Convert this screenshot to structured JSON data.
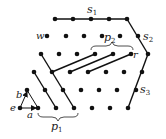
{
  "diagram": {
    "colors": {
      "dot": "#111111",
      "line": "#111111",
      "label": "#222222",
      "background": "#ffffff"
    },
    "labels": {
      "s1": "s",
      "s1_sub": "1",
      "s2": "s",
      "s2_sub": "2",
      "s3": "s",
      "s3_sub": "3",
      "p1": "p",
      "p1_sub": "1",
      "p2": "p",
      "p2_sub": "2",
      "w": "w",
      "r": "r",
      "a": "a",
      "b": "b",
      "e": "e"
    },
    "dots": [
      [
        55,
        19
      ],
      [
        73,
        19
      ],
      [
        91,
        19
      ],
      [
        109,
        19
      ],
      [
        127,
        19
      ],
      [
        47,
        36
      ],
      [
        66,
        36
      ],
      [
        84,
        36
      ],
      [
        102,
        36
      ],
      [
        120,
        36
      ],
      [
        138,
        36
      ],
      [
        41,
        54
      ],
      [
        59,
        54
      ],
      [
        77,
        54
      ],
      [
        95,
        54
      ],
      [
        113,
        54
      ],
      [
        131,
        54
      ],
      [
        148,
        54
      ],
      [
        34,
        72
      ],
      [
        52,
        72
      ],
      [
        70,
        72
      ],
      [
        88,
        72
      ],
      [
        106,
        72
      ],
      [
        124,
        72
      ],
      [
        142,
        72
      ],
      [
        27,
        90
      ],
      [
        45,
        90
      ],
      [
        63,
        90
      ],
      [
        81,
        90
      ],
      [
        99,
        90
      ],
      [
        117,
        90
      ],
      [
        136,
        90
      ],
      [
        20,
        108
      ],
      [
        38,
        108
      ],
      [
        56,
        108
      ],
      [
        74,
        108
      ],
      [
        92,
        108
      ],
      [
        110,
        108
      ],
      [
        128,
        108
      ]
    ],
    "segments": [
      [
        55,
        19,
        127,
        19
      ],
      [
        127,
        19,
        148,
        54
      ],
      [
        148,
        54,
        128,
        108
      ],
      [
        41,
        54,
        74,
        108
      ],
      [
        34,
        72,
        56,
        108
      ],
      [
        52,
        72,
        95,
        54
      ],
      [
        70,
        72,
        113,
        54
      ],
      [
        88,
        72,
        131,
        54
      ]
    ],
    "triangle": {
      "points": "20,108 27,90 38,108"
    },
    "arrows": [
      {
        "from": [
          20,
          108
        ],
        "to": [
          27,
          92
        ],
        "name": "b-arrow"
      },
      {
        "from": [
          20,
          108
        ],
        "to": [
          36,
          108
        ],
        "name": "a-arrow"
      }
    ]
  }
}
